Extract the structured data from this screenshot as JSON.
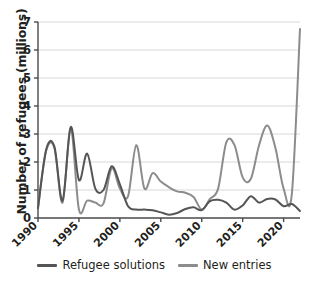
{
  "chart_data": {
    "type": "line",
    "title": "",
    "xlabel": "",
    "ylabel": "Number of refugees (millions)",
    "xlim": [
      1990,
      2022
    ],
    "ylim": [
      0,
      7
    ],
    "grid": true,
    "grid_axis": "y",
    "legend_position": "bottom",
    "y_ticks": [
      0,
      1,
      2,
      3,
      4,
      5,
      6,
      7
    ],
    "y_tick_labels": [
      "0",
      "1",
      "2",
      "3",
      "4",
      "5",
      "6",
      "7"
    ],
    "x_ticks": [
      1990,
      1995,
      2000,
      2005,
      2010,
      2015,
      2020
    ],
    "x_tick_labels": [
      "1990",
      "1995",
      "2000",
      "2005",
      "2010",
      "2015",
      "2020"
    ],
    "x_tick_rotation": 45,
    "x": [
      1990,
      1991,
      1992,
      1993,
      1994,
      1995,
      1996,
      1997,
      1998,
      1999,
      2000,
      2001,
      2002,
      2003,
      2004,
      2005,
      2006,
      2007,
      2008,
      2009,
      2010,
      2011,
      2012,
      2013,
      2014,
      2015,
      2016,
      2017,
      2018,
      2019,
      2020,
      2021,
      2022
    ],
    "series": [
      {
        "name": "Refugee solutions",
        "color": "#555555",
        "values": [
          0.35,
          2.45,
          2.55,
          0.62,
          3.25,
          1.35,
          2.3,
          1.05,
          1.0,
          1.85,
          1.2,
          0.42,
          0.3,
          0.3,
          0.28,
          0.2,
          0.12,
          0.18,
          0.32,
          0.38,
          0.28,
          0.6,
          0.65,
          0.55,
          0.3,
          0.45,
          0.78,
          0.55,
          0.68,
          0.66,
          0.42,
          0.5,
          0.25
        ]
      },
      {
        "name": "New entries",
        "color": "#8c8c8c",
        "values": [
          0.38,
          2.4,
          2.5,
          0.55,
          3.2,
          0.3,
          0.62,
          0.55,
          0.52,
          1.78,
          1.05,
          0.78,
          2.6,
          1.05,
          1.6,
          1.3,
          1.1,
          0.95,
          0.9,
          0.75,
          0.3,
          0.68,
          1.05,
          2.7,
          2.6,
          1.45,
          1.4,
          2.6,
          3.3,
          2.5,
          1.05,
          0.85,
          6.75
        ]
      }
    ]
  },
  "legend": {
    "entries": [
      {
        "label": "Refugee solutions",
        "color": "#555555"
      },
      {
        "label": "New entries",
        "color": "#8c8c8c"
      }
    ]
  }
}
